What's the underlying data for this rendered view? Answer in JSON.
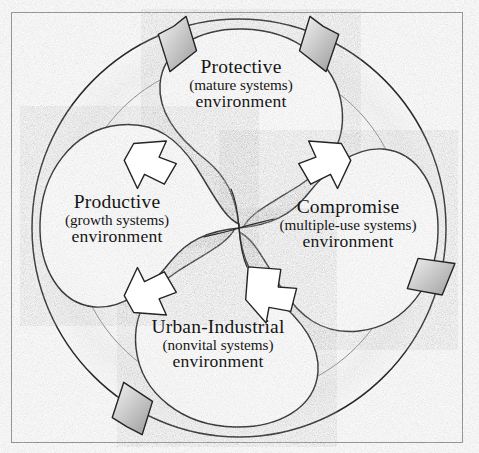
{
  "diagram": {
    "style": "hand-drawn pencil sketch",
    "frame_color": "#8d8d8d",
    "ink_color": "#1a1a1a",
    "shade_color": "#9a9a9a",
    "background": "#ffffff",
    "lobes": [
      {
        "id": "protective",
        "position": "top",
        "line1": "Protective",
        "line2": "(mature systems)",
        "line3": "environment"
      },
      {
        "id": "productive",
        "position": "left",
        "line1": "Productive",
        "line2": "(growth systems)",
        "line3": "environment"
      },
      {
        "id": "compromise",
        "position": "right",
        "line1": "Compromise",
        "line2": "(multiple-use systems)",
        "line3": "environment"
      },
      {
        "id": "urban-industrial",
        "position": "bottom",
        "line1": "Urban-Industrial",
        "line2": "(nonvital systems)",
        "line3": "environment"
      }
    ],
    "arrows": {
      "count_outward": 4,
      "count_inward": 4,
      "direction": "clockwise"
    }
  }
}
